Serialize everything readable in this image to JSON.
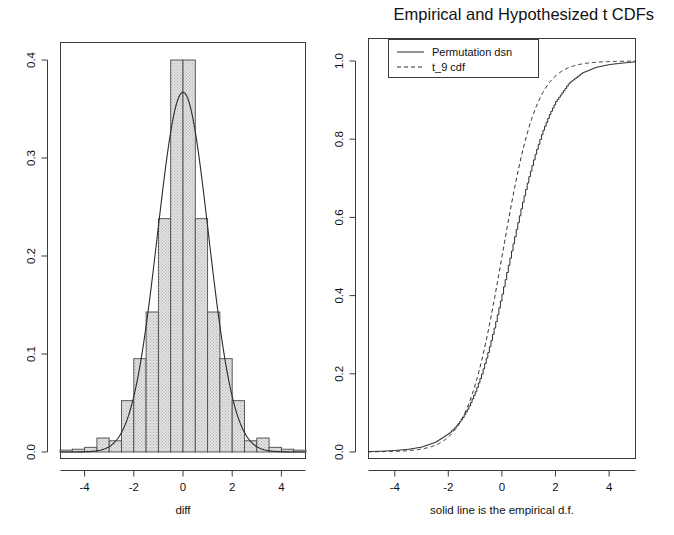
{
  "figure": {
    "title": "Empirical and Hypothesized t CDFs",
    "width": 674,
    "height": 535,
    "background": "#ffffff",
    "foreground": "#1a1a1a",
    "panels": 2
  },
  "left_panel": {
    "xlabel": "diff",
    "ylabel": "",
    "xticks": [
      "-4",
      "-2",
      "0",
      "2",
      "4"
    ],
    "yticks": [
      "0.0",
      "0.1",
      "0.2",
      "0.3",
      "0.4"
    ]
  },
  "right_panel": {
    "xlabel": "solid line is the empirical d.f.",
    "ylabel": "",
    "xticks": [
      "-4",
      "-2",
      "0",
      "2",
      "4"
    ],
    "yticks": [
      "0.0",
      "0.2",
      "0.4",
      "0.6",
      "0.8",
      "1.0"
    ],
    "legend": {
      "position": "top-left",
      "entries": [
        {
          "label": "Permutation dsn",
          "style": "solid"
        },
        {
          "label": "t_9 cdf",
          "style": "dashed"
        }
      ]
    }
  },
  "chart_data": [
    {
      "type": "bar",
      "id": "histogram-diff",
      "title": "",
      "xlabel": "diff",
      "ylabel": "",
      "xlim": [
        -5,
        5
      ],
      "ylim": [
        0,
        0.44
      ],
      "grid": false,
      "legend_position": "none",
      "bin_width": 0.5,
      "bin_edges": [
        -5,
        -4.5,
        -4,
        -3.5,
        -3,
        -2.5,
        -2,
        -1.5,
        -1,
        -0.5,
        0,
        0.5,
        1,
        1.5,
        2,
        2.5,
        3,
        3.5,
        4,
        4.5,
        5
      ],
      "bin_centers": [
        -4.75,
        -4.25,
        -3.75,
        -3.25,
        -2.75,
        -2.25,
        -1.75,
        -1.25,
        -0.75,
        -0.25,
        0.25,
        0.75,
        1.25,
        1.75,
        2.25,
        2.75,
        3.25,
        3.75,
        4.25,
        4.75
      ],
      "values": [
        0.002,
        0.003,
        0.005,
        0.015,
        0.012,
        0.055,
        0.1,
        0.15,
        0.25,
        0.42,
        0.42,
        0.25,
        0.15,
        0.1,
        0.055,
        0.012,
        0.015,
        0.005,
        0.003,
        0.002
      ],
      "bar_fill": "#d8d8d8",
      "bar_edge": "#4a4a4a",
      "overlay": {
        "type": "line",
        "name": "normal density",
        "peak_value": 0.385,
        "mean": 0,
        "sd": 1.035
      }
    },
    {
      "type": "line",
      "id": "cdf-comparison",
      "title": "Empirical and Hypothesized t CDFs",
      "xlabel": "solid line is the empirical d.f.",
      "ylabel": "",
      "xlim": [
        -5,
        5
      ],
      "ylim": [
        0,
        1.0
      ],
      "grid": false,
      "legend_position": "top-left",
      "series": [
        {
          "name": "Permutation dsn",
          "style": "solid",
          "x": [
            -5,
            -4.5,
            -4,
            -3.5,
            -3,
            -2.5,
            -2,
            -1.75,
            -1.5,
            -1.25,
            -1,
            -0.75,
            -0.5,
            -0.25,
            0,
            0.25,
            0.5,
            0.75,
            1,
            1.25,
            1.5,
            1.75,
            2,
            2.5,
            3,
            3.5,
            4,
            4.5,
            5
          ],
          "values": [
            0.001,
            0.002,
            0.004,
            0.007,
            0.013,
            0.025,
            0.047,
            0.063,
            0.085,
            0.115,
            0.154,
            0.202,
            0.261,
            0.329,
            0.404,
            0.482,
            0.56,
            0.635,
            0.704,
            0.765,
            0.818,
            0.861,
            0.896,
            0.944,
            0.97,
            0.984,
            0.991,
            0.995,
            0.998
          ]
        },
        {
          "name": "t_9 cdf",
          "style": "dashed",
          "x": [
            -5,
            -4.5,
            -4,
            -3.5,
            -3,
            -2.5,
            -2,
            -1.75,
            -1.5,
            -1.25,
            -1,
            -0.75,
            -0.5,
            -0.25,
            0,
            0.25,
            0.5,
            0.75,
            1,
            1.25,
            1.5,
            1.75,
            2,
            2.5,
            3,
            3.5,
            4,
            4.5,
            5
          ],
          "values": [
            0.0004,
            0.0007,
            0.0015,
            0.0034,
            0.0075,
            0.0171,
            0.0383,
            0.0569,
            0.0838,
            0.1211,
            0.1717,
            0.2368,
            0.3143,
            0.4041,
            0.5,
            0.5959,
            0.6857,
            0.7632,
            0.8283,
            0.8789,
            0.9162,
            0.9431,
            0.9617,
            0.9829,
            0.9925,
            0.9966,
            0.9985,
            0.9993,
            0.9996
          ]
        }
      ]
    }
  ]
}
